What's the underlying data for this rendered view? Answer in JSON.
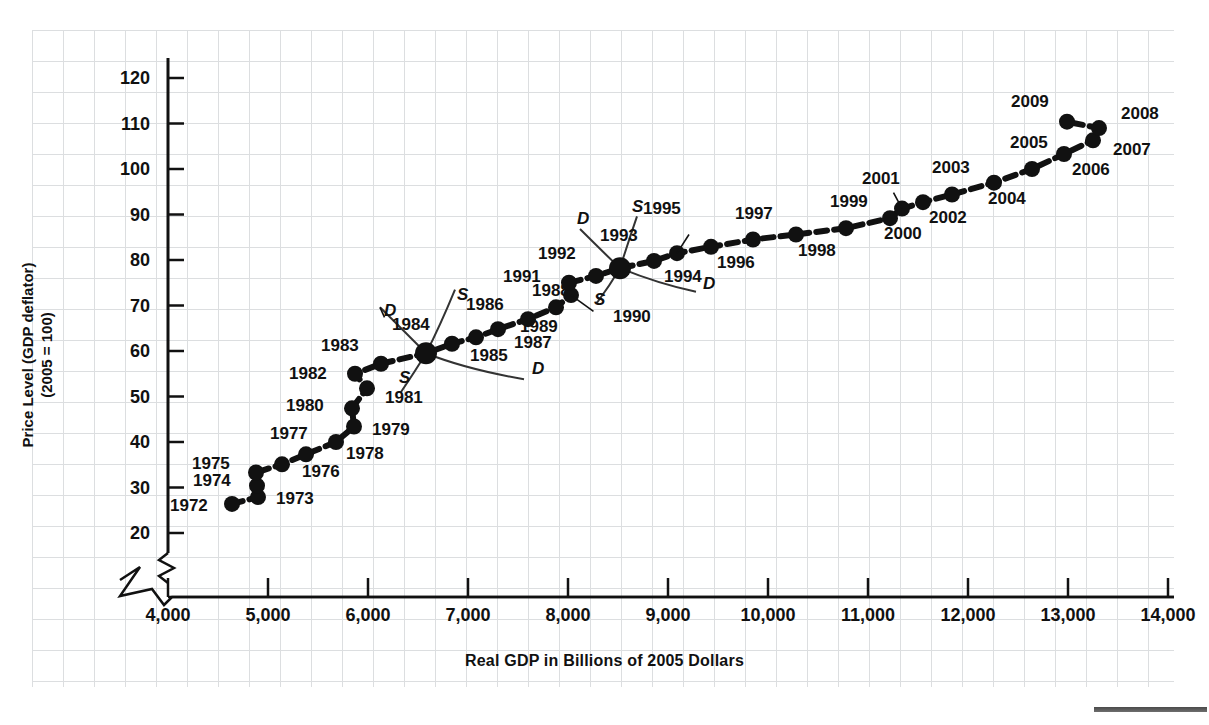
{
  "chart_data": {
    "type": "scatter",
    "title": "",
    "xlabel": "Real GDP in Billions of 2005 Dollars",
    "ylabel_line1": "Price Level (GDP deflator)",
    "ylabel_line2": "(2005 = 100)",
    "xlim": [
      3600,
      14500
    ],
    "ylim": [
      17,
      124
    ],
    "xticks": [
      "4,000",
      "5,000",
      "6,000",
      "7,000",
      "8,000",
      "9,000",
      "10,000",
      "11,000",
      "12,000",
      "13,000",
      "14,000"
    ],
    "xtick_values": [
      4000,
      5000,
      6000,
      7000,
      8000,
      9000,
      10000,
      11000,
      12000,
      13000,
      14000
    ],
    "yticks": [
      "20",
      "30",
      "40",
      "50",
      "60",
      "70",
      "80",
      "90",
      "100",
      "110",
      "120"
    ],
    "ytick_values": [
      20,
      30,
      40,
      50,
      60,
      70,
      80,
      90,
      100,
      110,
      120
    ],
    "grid": true,
    "axis_break_x": true,
    "legend": "none",
    "series": [
      {
        "name": "AD/AS equilibrium path",
        "points": [
          {
            "label": "1972",
            "x": 4640,
            "y": 26.4,
            "lx": -62,
            "ly": 2,
            "big": false
          },
          {
            "label": "1973",
            "x": 4900,
            "y": 27.9,
            "lx": 18,
            "ly": 2,
            "big": false
          },
          {
            "label": "1974",
            "x": 4890,
            "y": 30.4,
            "lx": -64,
            "ly": -5,
            "big": false
          },
          {
            "label": "1975",
            "x": 4880,
            "y": 33.3,
            "lx": -64,
            "ly": -8,
            "big": false
          },
          {
            "label": "1976",
            "x": 5140,
            "y": 35.1,
            "lx": 20,
            "ly": 8,
            "big": false
          },
          {
            "label": "1977",
            "x": 5380,
            "y": 37.3,
            "lx": -36,
            "ly": -20,
            "big": false
          },
          {
            "label": "1978",
            "x": 5680,
            "y": 40.0,
            "lx": 10,
            "ly": 12,
            "big": false
          },
          {
            "label": "1979",
            "x": 5860,
            "y": 43.4,
            "lx": 18,
            "ly": 3,
            "big": false
          },
          {
            "label": "1980",
            "x": 5840,
            "y": 47.4,
            "lx": -66,
            "ly": -2,
            "big": false
          },
          {
            "label": "1981",
            "x": 5990,
            "y": 51.8,
            "lx": 18,
            "ly": 10,
            "big": false
          },
          {
            "label": "1982",
            "x": 5870,
            "y": 55.0,
            "lx": -66,
            "ly": 0,
            "big": false
          },
          {
            "label": "1983",
            "x": 6130,
            "y": 57.2,
            "lx": -60,
            "ly": -18,
            "big": false
          },
          {
            "label": "1984",
            "x": 6580,
            "y": 59.5,
            "lx": -34,
            "ly": -28,
            "big": true
          },
          {
            "label": "1985",
            "x": 6840,
            "y": 61.6,
            "lx": 18,
            "ly": 12,
            "big": false
          },
          {
            "label": "1986",
            "x": 7080,
            "y": 63.0,
            "lx": -10,
            "ly": -32,
            "big": false
          },
          {
            "label": "1987",
            "x": 7300,
            "y": 64.8,
            "lx": 16,
            "ly": 14,
            "big": false
          },
          {
            "label": "1988",
            "x": 7600,
            "y": 67.0,
            "lx": 4,
            "ly": -28,
            "big": false
          },
          {
            "label": "1989",
            "x": 7880,
            "y": 69.6,
            "lx": -36,
            "ly": 20,
            "big": false
          },
          {
            "label": "1990",
            "x": 8030,
            "y": 72.3,
            "lx": 42,
            "ly": 22,
            "big": false
          },
          {
            "label": "1991",
            "x": 8010,
            "y": 75.0,
            "lx": -66,
            "ly": -6,
            "big": false
          },
          {
            "label": "1992",
            "x": 8280,
            "y": 76.5,
            "lx": -58,
            "ly": -22,
            "big": false
          },
          {
            "label": "1993",
            "x": 8520,
            "y": 78.2,
            "lx": -20,
            "ly": -32,
            "big": true
          },
          {
            "label": "1994",
            "x": 8860,
            "y": 79.8,
            "lx": 10,
            "ly": 16,
            "big": false
          },
          {
            "label": "1995",
            "x": 9090,
            "y": 81.5,
            "lx": -34,
            "ly": -44,
            "big": false
          },
          {
            "label": "1996",
            "x": 9430,
            "y": 82.9,
            "lx": 6,
            "ly": 16,
            "big": false
          },
          {
            "label": "1997",
            "x": 9850,
            "y": 84.5,
            "lx": -18,
            "ly": -26,
            "big": false
          },
          {
            "label": "1998",
            "x": 10280,
            "y": 85.6,
            "lx": 2,
            "ly": 16,
            "big": false
          },
          {
            "label": "1999",
            "x": 10780,
            "y": 87.0,
            "lx": -16,
            "ly": -26,
            "big": false
          },
          {
            "label": "2000",
            "x": 11220,
            "y": 89.2,
            "lx": -6,
            "ly": 16,
            "big": false
          },
          {
            "label": "2001",
            "x": 11340,
            "y": 91.3,
            "lx": -40,
            "ly": -30,
            "big": false
          },
          {
            "label": "2002",
            "x": 11550,
            "y": 92.7,
            "lx": 6,
            "ly": 16,
            "big": false
          },
          {
            "label": "2003",
            "x": 11840,
            "y": 94.4,
            "lx": -20,
            "ly": -26,
            "big": false
          },
          {
            "label": "2004",
            "x": 12260,
            "y": 97.0,
            "lx": -6,
            "ly": 16,
            "big": false
          },
          {
            "label": "2005",
            "x": 12640,
            "y": 100.0,
            "lx": -22,
            "ly": -26,
            "big": false
          },
          {
            "label": "2006",
            "x": 12960,
            "y": 103.3,
            "lx": 8,
            "ly": 16,
            "big": false
          },
          {
            "label": "2007",
            "x": 13250,
            "y": 106.3,
            "lx": 20,
            "ly": 10,
            "big": false
          },
          {
            "label": "2008",
            "x": 13310,
            "y": 109.0,
            "lx": 22,
            "ly": -14,
            "big": false
          },
          {
            "label": "2009",
            "x": 12990,
            "y": 110.4,
            "lx": -56,
            "ly": -20,
            "big": false
          }
        ]
      }
    ],
    "annotations": [
      {
        "text": "D",
        "x": 6160,
        "y": 68.5,
        "role": "demand-curve-label-1984"
      },
      {
        "text": "S",
        "x": 6310,
        "y": 53.8,
        "role": "supply-curve-label-1984"
      },
      {
        "text": "S",
        "x": 6890,
        "y": 72.0,
        "role": "supply-curve-label-1984-upper"
      },
      {
        "text": "D",
        "x": 7640,
        "y": 55.8,
        "role": "demand-curve-label-1984-lower"
      },
      {
        "text": "D",
        "x": 8090,
        "y": 88.8,
        "role": "demand-curve-label-1993"
      },
      {
        "text": "S",
        "x": 8260,
        "y": 71.0,
        "role": "supply-curve-label-1993"
      },
      {
        "text": "S",
        "x": 8640,
        "y": 91.5,
        "role": "supply-curve-label-1993-upper"
      },
      {
        "text": "D",
        "x": 9350,
        "y": 74.5,
        "role": "demand-curve-label-1993-lower"
      }
    ]
  }
}
